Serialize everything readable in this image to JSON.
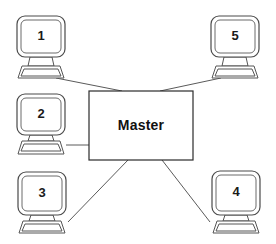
{
  "diagram": {
    "type": "star-network-topology",
    "background_color": "#ffffff",
    "line_color": "#5a5a5a",
    "outline_color": "#4a4a4a",
    "text_color": "#111111",
    "hub": {
      "label": "Master",
      "shape": "rectangle",
      "x": 89,
      "y": 91,
      "width": 104,
      "height": 69
    },
    "nodes": [
      {
        "id": "node-1",
        "label": "1",
        "icon": "computer-monitor-icon",
        "position": "top-left",
        "x": 17,
        "y": 16,
        "width": 48,
        "height": 41
      },
      {
        "id": "node-5",
        "label": "5",
        "icon": "computer-monitor-icon",
        "position": "top-right",
        "x": 211,
        "y": 16,
        "width": 48,
        "height": 41
      },
      {
        "id": "node-2",
        "label": "2",
        "icon": "computer-monitor-icon",
        "position": "middle-left",
        "x": 17,
        "y": 94,
        "width": 48,
        "height": 41
      },
      {
        "id": "node-3",
        "label": "3",
        "icon": "computer-monitor-icon",
        "position": "bottom-left",
        "x": 18,
        "y": 172,
        "width": 48,
        "height": 43
      },
      {
        "id": "node-4",
        "label": "4",
        "icon": "computer-monitor-icon",
        "position": "bottom-right",
        "x": 212,
        "y": 171,
        "width": 48,
        "height": 44
      }
    ],
    "connections": [
      {
        "id": "link-1-master",
        "from": "node-1",
        "to": "hub",
        "x1": 56,
        "y1": 78,
        "x2": 122,
        "y2": 91
      },
      {
        "id": "link-5-master",
        "from": "node-5",
        "to": "hub",
        "x1": 221,
        "y1": 78,
        "x2": 160,
        "y2": 91
      },
      {
        "id": "link-2-master",
        "from": "node-2",
        "to": "hub",
        "x1": 66,
        "y1": 145,
        "x2": 89,
        "y2": 145
      },
      {
        "id": "link-3-master",
        "from": "node-3",
        "to": "hub",
        "x1": 68,
        "y1": 222,
        "x2": 128,
        "y2": 160
      },
      {
        "id": "link-4-master",
        "from": "node-4",
        "to": "hub",
        "x1": 210,
        "y1": 222,
        "x2": 162,
        "y2": 160
      }
    ]
  }
}
